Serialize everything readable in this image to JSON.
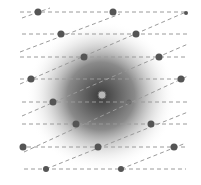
{
  "diagram": {
    "title": "",
    "width": 201,
    "height": 185,
    "background": "#ffffff",
    "blob": {
      "cx": 101,
      "cy": 96,
      "r": 75,
      "inner_color": "#3a3a3a",
      "mid_color": "#8a8a8a",
      "outer_color": "#ffffff"
    },
    "line_color": "#9a9a9a",
    "dot_color": "#555555",
    "center_dot_color": "#b8b8b8",
    "h_lines": [
      {
        "y": 12,
        "x1": 20,
        "x2": 188
      },
      {
        "y": 34,
        "x1": 22,
        "x2": 188
      },
      {
        "y": 57,
        "x1": 20,
        "x2": 188
      },
      {
        "y": 79,
        "x1": 20,
        "x2": 188
      },
      {
        "y": 102,
        "x1": 22,
        "x2": 188
      },
      {
        "y": 124,
        "x1": 22,
        "x2": 188
      },
      {
        "y": 147,
        "x1": 20,
        "x2": 188
      },
      {
        "y": 169,
        "x1": 24,
        "x2": 186
      }
    ],
    "d_lines": [
      {
        "x1": 22,
        "y1": 18,
        "x2": 50,
        "y2": 8
      },
      {
        "x1": 20,
        "y1": 52,
        "x2": 120,
        "y2": 14
      },
      {
        "x1": 20,
        "y1": 84,
        "x2": 186,
        "y2": 12
      },
      {
        "x1": 22,
        "y1": 116,
        "x2": 188,
        "y2": 44
      },
      {
        "x1": 24,
        "y1": 152,
        "x2": 188,
        "y2": 76
      },
      {
        "x1": 46,
        "y1": 169,
        "x2": 188,
        "y2": 112
      },
      {
        "x1": 121,
        "y1": 169,
        "x2": 186,
        "y2": 143
      }
    ],
    "dots": [
      {
        "x": 38,
        "y": 12,
        "r": 3.5
      },
      {
        "x": 113,
        "y": 12,
        "r": 3.5
      },
      {
        "x": 186,
        "y": 13,
        "r": 2
      },
      {
        "x": 61,
        "y": 34,
        "r": 3.5
      },
      {
        "x": 136,
        "y": 34,
        "r": 3.5
      },
      {
        "x": 84,
        "y": 57,
        "r": 3.5
      },
      {
        "x": 159,
        "y": 57,
        "r": 3.5
      },
      {
        "x": 31,
        "y": 79,
        "r": 3.5
      },
      {
        "x": 181,
        "y": 79,
        "r": 3.5
      },
      {
        "x": 53,
        "y": 102,
        "r": 3.5
      },
      {
        "x": 129,
        "y": 102,
        "r": 2.5,
        "faint": true
      },
      {
        "x": 76,
        "y": 124,
        "r": 3.5
      },
      {
        "x": 151,
        "y": 124,
        "r": 3.5
      },
      {
        "x": 23,
        "y": 147,
        "r": 3.5
      },
      {
        "x": 98,
        "y": 147,
        "r": 3.5
      },
      {
        "x": 174,
        "y": 147,
        "r": 3.5
      },
      {
        "x": 46,
        "y": 169,
        "r": 3
      },
      {
        "x": 121,
        "y": 169,
        "r": 3
      }
    ],
    "center_dot": {
      "x": 102,
      "y": 95,
      "r": 4
    }
  }
}
